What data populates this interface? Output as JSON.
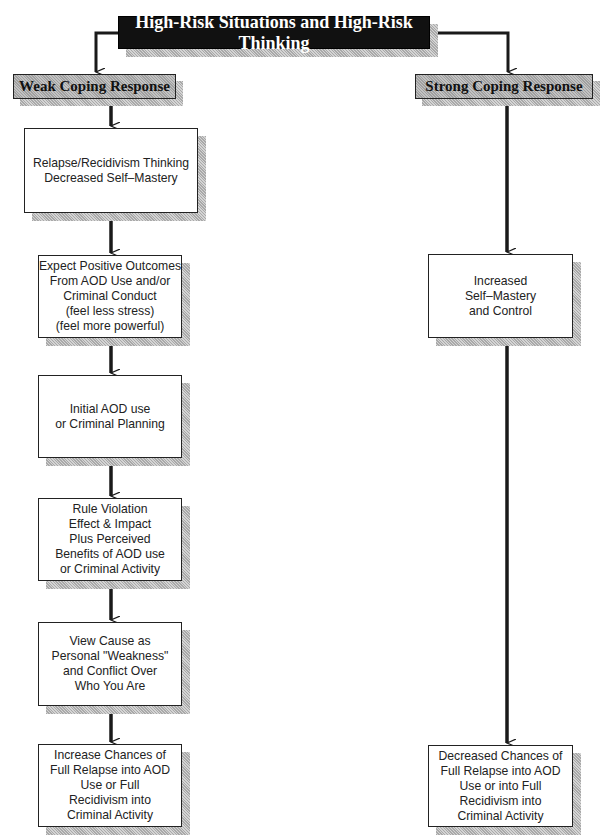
{
  "diagram": {
    "title": "High-Risk Situations and High-Risk Thinking",
    "branches": {
      "weak": {
        "label": "Weak Coping Response",
        "steps": [
          {
            "lines": [
              "Relapse/Recidivism Thinking",
              "Decreased Self–Mastery"
            ]
          },
          {
            "lines": [
              "Expect Positive Outcomes",
              "From AOD Use and/or",
              "Criminal Conduct",
              "(feel less stress)",
              "(feel more powerful)"
            ]
          },
          {
            "lines": [
              "Initial AOD use",
              "or Criminal Planning"
            ]
          },
          {
            "lines": [
              "Rule Violation",
              "Effect & Impact",
              "Plus Perceived",
              "Benefits of AOD use",
              "or Criminal Activity"
            ]
          },
          {
            "lines": [
              "View Cause as",
              "Personal \"Weakness\"",
              "and Conflict Over",
              "Who You Are"
            ]
          },
          {
            "lines": [
              "Increase Chances of",
              "Full Relapse into AOD",
              "Use or Full",
              "Recidivism into",
              "Criminal Activity"
            ]
          }
        ]
      },
      "strong": {
        "label": "Strong Coping Response",
        "steps": [
          {
            "lines": [
              "Increased",
              "Self–Mastery",
              "and Control"
            ]
          },
          {
            "lines": [
              "Decreased Chances of",
              "Full Relapse into AOD",
              "Use or into Full",
              "Recidivism into",
              "Criminal Activity"
            ]
          }
        ]
      }
    },
    "colors": {
      "title_bg": "#111111",
      "title_text": "#ffffff",
      "coping_fill": "#b3b3b3",
      "line": "#1a1a1a"
    }
  }
}
